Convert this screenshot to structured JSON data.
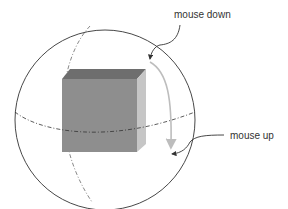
{
  "labels": {
    "mouse_down": "mouse down",
    "mouse_up": "mouse up"
  },
  "colors": {
    "cube_front": "#8e8e8e",
    "cube_top": "#6e6e6e",
    "cube_side": "#c6c6c6",
    "sphere_outline": "#333333",
    "drag_path": "#bdbdbd",
    "pointer_line": "#333333"
  }
}
